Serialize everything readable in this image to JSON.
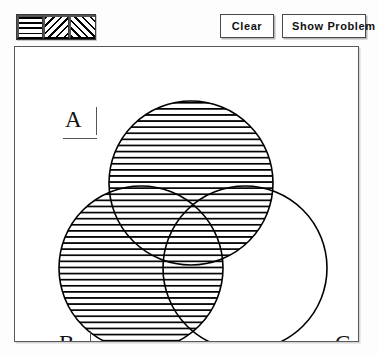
{
  "app": {
    "title": "Venn Diagram Shading Tool"
  },
  "toolbar": {
    "patterns": [
      {
        "name": "horizontal-lines",
        "label": "Horizontal line fill"
      },
      {
        "name": "backslash-lines",
        "label": "Backward diagonal fill"
      },
      {
        "name": "forwardslash-lines",
        "label": "Forward diagonal fill"
      }
    ],
    "clear_label": "Clear",
    "show_problem_label": "Show Problem"
  },
  "canvas": {
    "labels": {
      "a": "A",
      "b": "B",
      "c": "C"
    },
    "colors": {
      "stroke": "#000000",
      "fill_blank": "#ffffff",
      "hatch": "#000000",
      "frame": "#5a5a5a"
    },
    "circles": [
      {
        "id": "A",
        "cx": 176,
        "cy": 136,
        "r": 82,
        "shaded": true,
        "pattern": "horizontal-lines"
      },
      {
        "id": "B",
        "cx": 126,
        "cy": 221,
        "r": 82,
        "shaded": true,
        "pattern": "horizontal-lines"
      },
      {
        "id": "C",
        "cx": 230,
        "cy": 221,
        "r": 82,
        "shaded": false,
        "pattern": "none"
      }
    ],
    "regions": [
      {
        "id": "A-only",
        "shaded": true
      },
      {
        "id": "B-only",
        "shaded": true
      },
      {
        "id": "C-only",
        "shaded": false
      },
      {
        "id": "A-and-B",
        "shaded": true
      },
      {
        "id": "A-and-C",
        "shaded": true
      },
      {
        "id": "B-and-C",
        "shaded": true
      },
      {
        "id": "A-B-C",
        "shaded": true
      }
    ]
  }
}
